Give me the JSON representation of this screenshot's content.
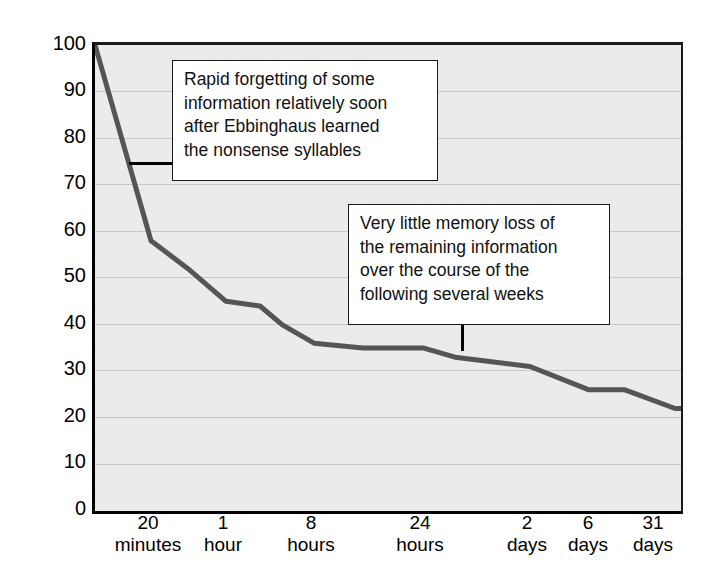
{
  "chart_data": {
    "type": "line",
    "title": "",
    "subtitle": "",
    "xlabel": "",
    "ylabel": "Average Percentage of Information Retained",
    "ylim": [
      0,
      100
    ],
    "ytick_values": [
      100,
      90,
      80,
      70,
      60,
      50,
      40,
      30,
      20,
      10,
      0
    ],
    "grid": true,
    "legend": "none",
    "xtick_labels": [
      {
        "line1": "20",
        "line2": "minutes"
      },
      {
        "line1": "1",
        "line2": "hour"
      },
      {
        "line1": "8",
        "line2": "hours"
      },
      {
        "line1": "24",
        "line2": "hours"
      },
      {
        "line1": "2",
        "line2": "days"
      },
      {
        "line1": "6",
        "line2": "days"
      },
      {
        "line1": "31",
        "line2": "days"
      }
    ],
    "series": [
      {
        "name": "Average percentage of information retained",
        "color": "#555555",
        "x": [
          "0",
          "20 minutes",
          "40 minutes",
          "1 hour",
          "2 hours",
          "4 hours",
          "8 hours",
          "14 hours",
          "24 hours",
          "30 hours",
          "2 days",
          "4 days",
          "6 days",
          "15 days",
          "31 days"
        ],
        "values": [
          100,
          58,
          52,
          45,
          44,
          40,
          36,
          35,
          35,
          33,
          31,
          26,
          26,
          22,
          22
        ]
      }
    ],
    "annotations": [
      {
        "id": "rapid-forgetting",
        "lines": [
          "Rapid forgetting of some",
          "information relatively soon",
          "after Ebbinghaus learned",
          "the nonsense syllables"
        ]
      },
      {
        "id": "little-memory-loss",
        "lines": [
          "Very little memory loss of",
          "the remaining information",
          "over the course of the",
          "following several weeks"
        ]
      }
    ],
    "colors": {
      "plot_background": "#ebebeb",
      "gridline": "#c9c9c9",
      "axis": "#000000",
      "line": "#555555",
      "callout_background": "#ffffff",
      "callout_border": "#1a1a1a"
    }
  }
}
